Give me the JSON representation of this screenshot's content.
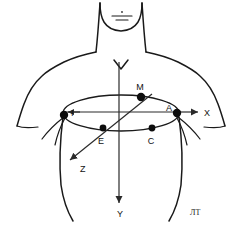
{
  "figure": {
    "caption_mark": "ЛТ",
    "stroke_color": "#1a1a1a",
    "electrode_color": "#0d0d0d",
    "background_color": "#ffffff",
    "width": 242,
    "height": 228
  },
  "axes": [
    {
      "id": "x",
      "label": "X",
      "label_x": 207,
      "label_y": 116,
      "from_x": 179,
      "from_y": 112,
      "to_x": 200,
      "to_y": 112
    },
    {
      "id": "y",
      "label": "Y",
      "label_x": 122,
      "label_y": 214,
      "from_x": 119,
      "from_y": 62,
      "to_x": 119,
      "to_y": 205
    },
    {
      "id": "z",
      "label": "Z",
      "label_x": 80,
      "label_y": 171,
      "from_x": 150,
      "from_y": 97,
      "to_x": 67,
      "to_y": 163
    }
  ],
  "electrodes": [
    {
      "id": "I",
      "label": "I",
      "x": 64,
      "y": 115,
      "label_x": 71,
      "label_y": 115,
      "radius": 3.6
    },
    {
      "id": "E",
      "label": "E",
      "x": 103,
      "y": 128,
      "label_x": 100,
      "label_y": 142,
      "radius": 3.2
    },
    {
      "id": "C",
      "label": "C",
      "x": 152,
      "y": 128,
      "label_x": 149,
      "label_y": 142,
      "radius": 3.2
    },
    {
      "id": "A",
      "label": "A",
      "x": 177,
      "y": 113,
      "label_x": 168,
      "label_y": 113,
      "radius": 3.6
    },
    {
      "id": "M",
      "label": "M",
      "x": 141,
      "y": 97,
      "label_x": 138,
      "label_y": 90,
      "radius": 3.6
    }
  ],
  "markers": {
    "sternal_notch": "V",
    "chin_mark": "chin-line"
  }
}
